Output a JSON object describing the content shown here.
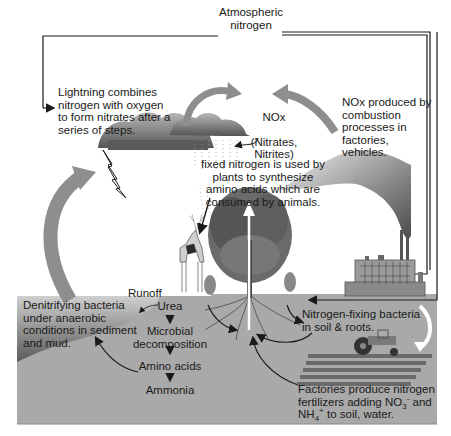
{
  "diagram": {
    "type": "nitrogen-cycle",
    "colors": {
      "soil": "#a9a9a9",
      "soil_border": "#8a8a8a",
      "arrow_gray": "#8e8e8e",
      "cloud_dark": "#6f6f6f",
      "cloud_light": "#a0a0a0",
      "line": "#1a1a1a",
      "background": "#ffffff"
    },
    "labels": {
      "atmospheric_nitrogen": "Atmospheric\nnitrogen",
      "lightning": "Lightning combines\nnitrogen with oxygen\nto form nitrates after a\nseries of steps.",
      "nox_title": "NOx",
      "nox_sub": "(Nitrates,\nNitrites)",
      "nox_combustion": "NOx produced by\ncombustion\nprocesses in\nfactories,\nvehicles.",
      "fixed_nitrogen": "fixed nitrogen is used by\nplants to synthesize\namino acids which are\nconsumed by animals.",
      "runoff": "Runoff",
      "denitrifying": "Denitrifying bacteria\nunder anaerobic\nconditions in sediment\nand mud.",
      "urea": "Urea",
      "microbial": "Microbial\ndecomposition",
      "amino_acids": "Amino acids",
      "ammonia": "Ammonia",
      "nitrogen_fixing": "Nitrogen-fixing bacteria\nin soil & roots.",
      "factories_line1": "Factories produce nitrogen",
      "factories_line2_a": "fertilizers adding NO",
      "factories_no3_sub": "3",
      "factories_no3_sup": "-",
      "factories_line2_b": " and",
      "factories_line3_a": "NH",
      "factories_nh4_sub": "4",
      "factories_nh4_sup": "+",
      "factories_line3_b": " to soil, water."
    },
    "icons": [
      "cloud-icon",
      "lightning-icon",
      "deer-icon",
      "tree-icon",
      "factory-icon",
      "smoke-icon",
      "tractor-icon",
      "field-rows-icon",
      "arrow-icon"
    ]
  }
}
